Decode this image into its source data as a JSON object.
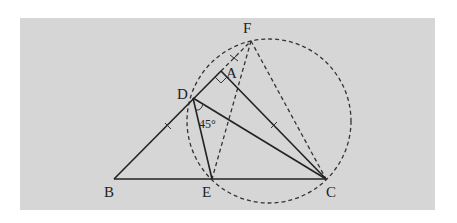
{
  "figure": {
    "background_color": "#d6d6d6",
    "stroke_color": "#222222",
    "points": {
      "A": {
        "label": "A",
        "x": 221,
        "y": 71
      },
      "B": {
        "label": "B",
        "x": 114,
        "y": 179
      },
      "C": {
        "label": "C",
        "x": 326,
        "y": 179
      },
      "D": {
        "label": "D",
        "x": 193,
        "y": 98
      },
      "E": {
        "label": "E",
        "x": 212,
        "y": 179
      },
      "F": {
        "label": "F",
        "x": 251,
        "y": 41
      }
    },
    "angle_label": "45°",
    "circle": {
      "cx": 269,
      "cy": 121,
      "r": 82,
      "style": "dashed"
    },
    "solid_segments": [
      "BC",
      "BA",
      "AC",
      "DE",
      "DC"
    ],
    "dashed_segments": [
      "AF",
      "FE",
      "FC"
    ],
    "marks": [
      "right angle at A",
      "tick on BD",
      "tick on AC",
      "cross tick on AF"
    ]
  }
}
